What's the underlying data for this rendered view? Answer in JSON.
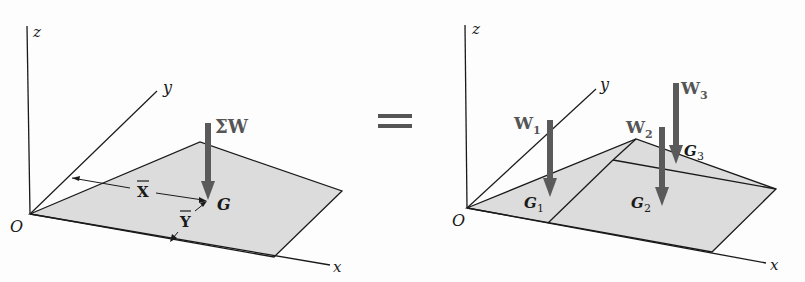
{
  "figure": {
    "left_panel": {
      "axes": {
        "z": "z",
        "y": "y",
        "x": "x",
        "origin": "O"
      },
      "resultant_label": "ΣW",
      "centroid_label": "G",
      "xbar_label": "X",
      "ybar_label": "Y"
    },
    "equals_sign": "=",
    "right_panel": {
      "axes": {
        "z": "z",
        "y": "y",
        "x": "x",
        "origin": "O"
      },
      "forces": [
        {
          "label": "W",
          "sub": "1",
          "centroid": "G",
          "centroid_sub": "1"
        },
        {
          "label": "W",
          "sub": "2",
          "centroid": "G",
          "centroid_sub": "2"
        },
        {
          "label": "W",
          "sub": "3",
          "centroid": "G",
          "centroid_sub": "3"
        }
      ]
    },
    "colors": {
      "plate_fill": "#dcdcdc",
      "arrow": "#5a5a5a",
      "line": "#1a1a1a"
    }
  }
}
